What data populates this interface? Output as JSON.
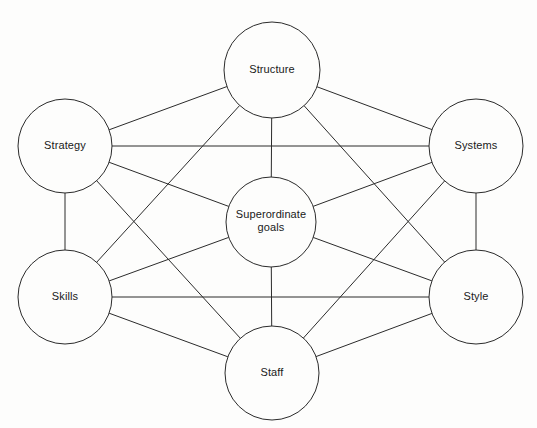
{
  "diagram": {
    "type": "network-diagram",
    "canvas": {
      "width": 537,
      "height": 428
    },
    "style": {
      "background_color": "#fdfdfc",
      "line_color": "#2b2b2b",
      "node_fill": "#fdfdfc",
      "node_stroke": "#2b2b2b",
      "text_color": "#1a1a1a"
    },
    "nodes": [
      {
        "id": "structure",
        "label": "Structure",
        "lines": [
          "Structure"
        ],
        "cx": 272,
        "cy": 70,
        "r": 48
      },
      {
        "id": "strategy",
        "label": "Strategy",
        "lines": [
          "Strategy"
        ],
        "cx": 65,
        "cy": 146,
        "r": 47
      },
      {
        "id": "systems",
        "label": "Systems",
        "lines": [
          "Systems"
        ],
        "cx": 476,
        "cy": 146,
        "r": 47
      },
      {
        "id": "goals",
        "label": "Superordinate goals",
        "lines": [
          "Superordinate",
          "goals"
        ],
        "cx": 271,
        "cy": 222,
        "r": 45
      },
      {
        "id": "skills",
        "label": "Skills",
        "lines": [
          "Skills"
        ],
        "cx": 65,
        "cy": 297,
        "r": 47
      },
      {
        "id": "style",
        "label": "Style",
        "lines": [
          "Style"
        ],
        "cx": 476,
        "cy": 297,
        "r": 47
      },
      {
        "id": "staff",
        "label": "Staff",
        "lines": [
          "Staff"
        ],
        "cx": 272,
        "cy": 373,
        "r": 47
      }
    ],
    "edges": [
      {
        "from": "structure",
        "to": "strategy"
      },
      {
        "from": "structure",
        "to": "systems"
      },
      {
        "from": "structure",
        "to": "goals"
      },
      {
        "from": "structure",
        "to": "skills"
      },
      {
        "from": "structure",
        "to": "style"
      },
      {
        "from": "strategy",
        "to": "systems"
      },
      {
        "from": "strategy",
        "to": "goals"
      },
      {
        "from": "strategy",
        "to": "skills"
      },
      {
        "from": "strategy",
        "to": "staff"
      },
      {
        "from": "systems",
        "to": "goals"
      },
      {
        "from": "systems",
        "to": "style"
      },
      {
        "from": "systems",
        "to": "staff"
      },
      {
        "from": "goals",
        "to": "skills"
      },
      {
        "from": "goals",
        "to": "style"
      },
      {
        "from": "goals",
        "to": "staff"
      },
      {
        "from": "skills",
        "to": "style"
      },
      {
        "from": "skills",
        "to": "staff"
      },
      {
        "from": "style",
        "to": "staff"
      }
    ]
  }
}
